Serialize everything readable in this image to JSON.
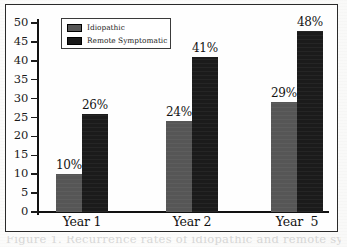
{
  "figure": {
    "caption_partial": "Figure 1.  Recurrence rates of idiopathic and remote symptomatic seizures"
  },
  "legend": {
    "position": "top-left-inside-plot",
    "entries": [
      {
        "label": "Idiopathic",
        "color": "#565656",
        "swatch_icon": "legend-swatch-gray"
      },
      {
        "label": "Remote Symptomatic",
        "color": "#191919",
        "swatch_icon": "legend-swatch-black"
      }
    ]
  },
  "axes": {
    "y_ticks": [
      "50",
      "45",
      "40",
      "35",
      "30",
      "25",
      "20",
      "15",
      "10",
      "5",
      "0"
    ],
    "x_ticks": [
      "Year 1",
      "Year 2",
      "Year  5"
    ]
  },
  "chart_data": {
    "type": "bar",
    "title": "",
    "xlabel": "",
    "ylabel": "",
    "ylim": [
      0,
      50
    ],
    "ytick_step": 5,
    "grid": false,
    "legend_position": "upper left",
    "categories": [
      "Year 1",
      "Year 2",
      "Year  5"
    ],
    "series": [
      {
        "name": "Idiopathic",
        "color": "#565656",
        "values": [
          10,
          24,
          29
        ],
        "data_labels": [
          "10%",
          "24%",
          "29%"
        ]
      },
      {
        "name": "Remote Symptomatic",
        "color": "#191919",
        "values": [
          26,
          41,
          48
        ],
        "data_labels": [
          "26%",
          "41%",
          "48%"
        ]
      }
    ]
  }
}
